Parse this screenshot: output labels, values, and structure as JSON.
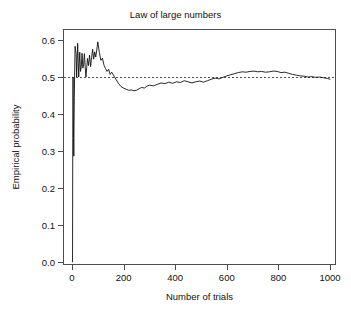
{
  "chart_data": {
    "type": "line",
    "title": "Law of large numbers",
    "xlabel": "Number of trials",
    "ylabel": "Empirical probability",
    "xlim": [
      0,
      1000
    ],
    "ylim": [
      0.0,
      0.6
    ],
    "xticks": [
      0,
      200,
      400,
      600,
      800,
      1000
    ],
    "xtick_labels": [
      "0",
      "200",
      "400",
      "600",
      "800",
      "1000"
    ],
    "yticks": [
      0.0,
      0.1,
      0.2,
      0.3,
      0.4,
      0.5,
      0.6
    ],
    "ytick_labels": [
      "0.0",
      "0.1",
      "0.2",
      "0.3",
      "0.4",
      "0.5",
      "0.6"
    ],
    "grid": false,
    "legend": null,
    "box": true,
    "line_color": "#111111",
    "reference_line": {
      "name": "true-probability",
      "orientation": "horizontal",
      "y": 0.5,
      "style": "dashed",
      "color": "#222222"
    },
    "series": [
      {
        "name": "Empirical probability of success",
        "x": [
          1,
          2,
          3,
          4,
          5,
          6,
          7,
          8,
          9,
          10,
          12,
          14,
          16,
          18,
          20,
          22,
          24,
          26,
          28,
          30,
          33,
          36,
          39,
          42,
          45,
          48,
          51,
          54,
          57,
          60,
          64,
          68,
          72,
          76,
          80,
          84,
          88,
          92,
          96,
          100,
          106,
          112,
          118,
          124,
          130,
          136,
          142,
          148,
          154,
          160,
          170,
          180,
          190,
          200,
          210,
          220,
          230,
          240,
          250,
          260,
          270,
          280,
          290,
          300,
          315,
          330,
          345,
          360,
          375,
          390,
          405,
          420,
          435,
          450,
          465,
          480,
          495,
          510,
          525,
          540,
          555,
          570,
          585,
          600,
          615,
          630,
          645,
          660,
          675,
          690,
          705,
          720,
          735,
          750,
          765,
          780,
          795,
          810,
          825,
          840,
          855,
          870,
          885,
          900,
          915,
          930,
          945,
          960,
          975,
          990,
          1000
        ],
        "y": [
          0.0,
          0.0,
          0.333,
          0.5,
          0.4,
          0.333,
          0.286,
          0.375,
          0.444,
          0.5,
          0.583,
          0.571,
          0.563,
          0.5,
          0.55,
          0.591,
          0.542,
          0.5,
          0.536,
          0.567,
          0.515,
          0.528,
          0.564,
          0.524,
          0.533,
          0.563,
          0.529,
          0.5,
          0.526,
          0.55,
          0.531,
          0.559,
          0.528,
          0.553,
          0.575,
          0.548,
          0.568,
          0.554,
          0.573,
          0.595,
          0.566,
          0.545,
          0.551,
          0.532,
          0.523,
          0.515,
          0.521,
          0.507,
          0.513,
          0.506,
          0.494,
          0.483,
          0.474,
          0.47,
          0.467,
          0.464,
          0.465,
          0.463,
          0.464,
          0.468,
          0.472,
          0.47,
          0.475,
          0.478,
          0.476,
          0.48,
          0.484,
          0.482,
          0.486,
          0.483,
          0.487,
          0.485,
          0.49,
          0.487,
          0.484,
          0.487,
          0.489,
          0.486,
          0.49,
          0.494,
          0.497,
          0.495,
          0.499,
          0.503,
          0.506,
          0.509,
          0.512,
          0.514,
          0.513,
          0.515,
          0.516,
          0.514,
          0.515,
          0.513,
          0.514,
          0.516,
          0.515,
          0.512,
          0.513,
          0.51,
          0.507,
          0.505,
          0.503,
          0.502,
          0.5,
          0.501,
          0.499,
          0.5,
          0.498,
          0.496,
          0.494
        ]
      }
    ],
    "geometry": {
      "plot_left": 63,
      "plot_right": 336,
      "plot_top": 29,
      "plot_bottom": 265,
      "x0_px": 72,
      "x1000_px": 330,
      "y0_px": 262,
      "y06_px": 40
    }
  }
}
